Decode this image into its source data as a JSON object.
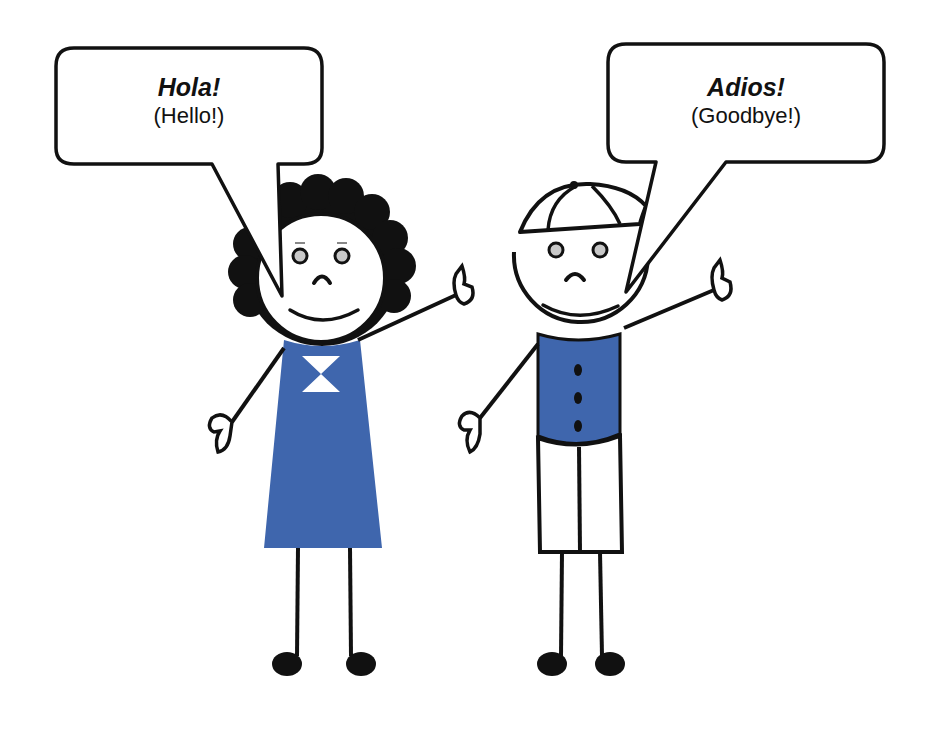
{
  "scene": {
    "description": "Two stick figures waving with speech bubbles",
    "colors": {
      "outline": "#111111",
      "clothing_blue": "#3f66ad",
      "eye_gray": "#c8c8c8",
      "background": "#ffffff"
    }
  },
  "bubbles": [
    {
      "speaker": "girl",
      "title": "Hola!",
      "translation": "(Hello!)"
    },
    {
      "speaker": "boy",
      "title": "Adios!",
      "translation": "(Goodbye!)"
    }
  ],
  "figures": [
    {
      "id": "girl",
      "hair": "curly black",
      "clothing": "blue dress with white bow"
    },
    {
      "id": "boy",
      "hair": "white cap",
      "clothing": "blue shirt with three buttons, white shorts"
    }
  ]
}
